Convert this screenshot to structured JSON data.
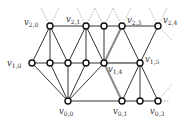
{
  "diagram": {
    "type": "graph",
    "colors": {
      "edge": "#333333",
      "highlight_edge": "#8a8a8a",
      "dotted": "#9a9a9a",
      "node_fill": "#ffffff",
      "node_stroke": "#111111"
    },
    "nodes": [
      {
        "id": "v2_0",
        "x": 50,
        "y": 26,
        "label": "v",
        "sub": "2,0",
        "lx": 24,
        "ly": 25
      },
      {
        "id": "v2_1",
        "x": 86,
        "y": 26,
        "label": "v",
        "sub": "2,1",
        "lx": 66,
        "ly": 22
      },
      {
        "id": "t104",
        "x": 104,
        "y": 26,
        "label": "",
        "sub": ""
      },
      {
        "id": "v2_3",
        "x": 122,
        "y": 26,
        "label": "v",
        "sub": "2,3",
        "lx": 127,
        "ly": 23
      },
      {
        "id": "v2_4",
        "x": 158,
        "y": 26,
        "label": "v",
        "sub": "2,4",
        "lx": 163,
        "ly": 23
      },
      {
        "id": "v1_0",
        "x": 32,
        "y": 63,
        "label": "v",
        "sub": "1,0",
        "lx": 7,
        "ly": 66
      },
      {
        "id": "m50",
        "x": 50,
        "y": 63,
        "label": "",
        "sub": ""
      },
      {
        "id": "m68",
        "x": 68,
        "y": 63,
        "label": "",
        "sub": ""
      },
      {
        "id": "m86",
        "x": 86,
        "y": 63,
        "label": "",
        "sub": ""
      },
      {
        "id": "v1_4",
        "x": 104,
        "y": 63,
        "label": "v",
        "sub": "1,4",
        "lx": 108,
        "ly": 72
      },
      {
        "id": "v1_5",
        "x": 140,
        "y": 63,
        "label": "v",
        "sub": "1,5",
        "lx": 145,
        "ly": 62
      },
      {
        "id": "v0_0",
        "x": 68,
        "y": 101,
        "label": "v",
        "sub": "0,0",
        "lx": 59,
        "ly": 114
      },
      {
        "id": "v0_1",
        "x": 122,
        "y": 101,
        "label": "v",
        "sub": "0,1",
        "lx": 113,
        "ly": 114
      },
      {
        "id": "b140",
        "x": 140,
        "y": 101,
        "label": "",
        "sub": ""
      },
      {
        "id": "v0_3",
        "x": 158,
        "y": 101,
        "label": "v",
        "sub": "0,3",
        "lx": 150,
        "ly": 114
      }
    ],
    "edges": [
      [
        "v2_0",
        "v2_1"
      ],
      [
        "v2_1",
        "t104"
      ],
      [
        "t104",
        "v2_3"
      ],
      [
        "v2_3",
        "v2_4"
      ],
      [
        "v1_0",
        "m50"
      ],
      [
        "m50",
        "m68"
      ],
      [
        "m68",
        "m86"
      ],
      [
        "m86",
        "v1_4"
      ],
      [
        "v0_0",
        "v0_1"
      ],
      [
        "v0_1",
        "b140"
      ],
      [
        "b140",
        "v0_3"
      ],
      [
        "v2_0",
        "v1_0"
      ],
      [
        "v2_0",
        "m50"
      ],
      [
        "v2_0",
        "m68"
      ],
      [
        "v2_1",
        "m68"
      ],
      [
        "v2_1",
        "m86"
      ],
      [
        "v2_1",
        "v1_4"
      ],
      [
        "t104",
        "v1_4"
      ],
      [
        "v2_3",
        "v1_5"
      ],
      [
        "v2_4",
        "v1_5"
      ],
      [
        "v1_0",
        "v0_0"
      ],
      [
        "m50",
        "v0_0"
      ],
      [
        "m68",
        "v0_0"
      ],
      [
        "m86",
        "v0_0"
      ],
      [
        "v1_4",
        "v0_0"
      ],
      [
        "v1_5",
        "v0_1"
      ],
      [
        "v1_5",
        "b140"
      ],
      [
        "v1_5",
        "v0_3"
      ]
    ],
    "highlight_edges": [
      [
        "v1_4",
        "v2_3"
      ],
      [
        "v1_4",
        "v1_5"
      ],
      [
        "v1_4",
        "v0_1"
      ]
    ],
    "dotted_stubs": [
      [
        50,
        26,
        41,
        8
      ],
      [
        50,
        26,
        59,
        8
      ],
      [
        86,
        26,
        77,
        8
      ],
      [
        86,
        26,
        95,
        8
      ],
      [
        104,
        26,
        95,
        8
      ],
      [
        104,
        26,
        113,
        8
      ],
      [
        122,
        26,
        113,
        8
      ],
      [
        122,
        26,
        131,
        8
      ],
      [
        158,
        26,
        149,
        8
      ],
      [
        158,
        26,
        167,
        8
      ],
      [
        158,
        26,
        172,
        40
      ],
      [
        158,
        101,
        172,
        84
      ],
      [
        158,
        101,
        170,
        101
      ]
    ]
  }
}
